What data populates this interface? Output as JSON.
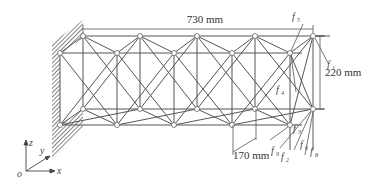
{
  "diagram": {
    "type": "3D space truss (cantilever) schematic",
    "dimensions": {
      "length": "730 mm",
      "height": "220 mm",
      "depth": "170 mm"
    },
    "force_labels": {
      "top": "f",
      "top_sub": "5",
      "right": "f",
      "right_sub": "1",
      "mid": "f",
      "mid_sub": "4",
      "near_bottom": "f",
      "near_bottom_sub": "3",
      "bottom_a": "f",
      "bottom_a_sub": "9",
      "bottom_b": "f",
      "bottom_b_sub": "2",
      "bottom_c": "f",
      "bottom_c_sub": "6",
      "bottom_d": "f",
      "bottom_d_sub": "8"
    },
    "axes": {
      "origin": "o",
      "x": "x",
      "y": "y",
      "z": "z"
    },
    "colors": {
      "line": "#555555",
      "node_fill": "#ffffff",
      "wall_hatch": "#888888"
    }
  }
}
